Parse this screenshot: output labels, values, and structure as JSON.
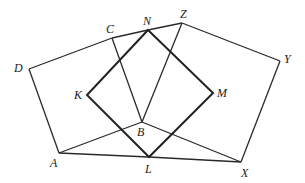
{
  "diagram": {
    "points": {
      "A": {
        "label": "A",
        "x": 59,
        "y": 153,
        "lx": 50,
        "ly": 167
      },
      "B": {
        "label": "B",
        "x": 142,
        "y": 122,
        "lx": 137,
        "ly": 136
      },
      "C": {
        "label": "C",
        "x": 112,
        "y": 38,
        "lx": 106,
        "ly": 33
      },
      "D": {
        "label": "D",
        "x": 29,
        "y": 69,
        "lx": 14,
        "ly": 72
      },
      "K": {
        "label": "K",
        "x": 87,
        "y": 95,
        "lx": 74,
        "ly": 99
      },
      "L": {
        "label": "L",
        "x": 149,
        "y": 157,
        "lx": 145,
        "ly": 173
      },
      "M": {
        "label": "M",
        "x": 213,
        "y": 93,
        "lx": 217,
        "ly": 97
      },
      "N": {
        "label": "N",
        "x": 148,
        "y": 30,
        "lx": 143,
        "ly": 25
      },
      "X": {
        "label": "X",
        "x": 241,
        "y": 162,
        "lx": 241,
        "ly": 177
      },
      "Y": {
        "label": "Y",
        "x": 280,
        "y": 61,
        "lx": 284,
        "ly": 63
      },
      "Z": {
        "label": "Z",
        "x": 182,
        "y": 23,
        "lx": 180,
        "ly": 18
      }
    },
    "segments": [
      [
        "D",
        "C"
      ],
      [
        "C",
        "N"
      ],
      [
        "N",
        "Z"
      ],
      [
        "Z",
        "Y"
      ],
      [
        "Y",
        "X"
      ],
      [
        "X",
        "L"
      ],
      [
        "L",
        "A"
      ],
      [
        "A",
        "D"
      ],
      [
        "C",
        "B"
      ],
      [
        "Z",
        "B"
      ],
      [
        "A",
        "B"
      ],
      [
        "B",
        "X"
      ]
    ],
    "square": [
      "N",
      "M",
      "L",
      "K"
    ],
    "colors": {
      "stroke": "#222222",
      "background": "#ffffff"
    }
  }
}
